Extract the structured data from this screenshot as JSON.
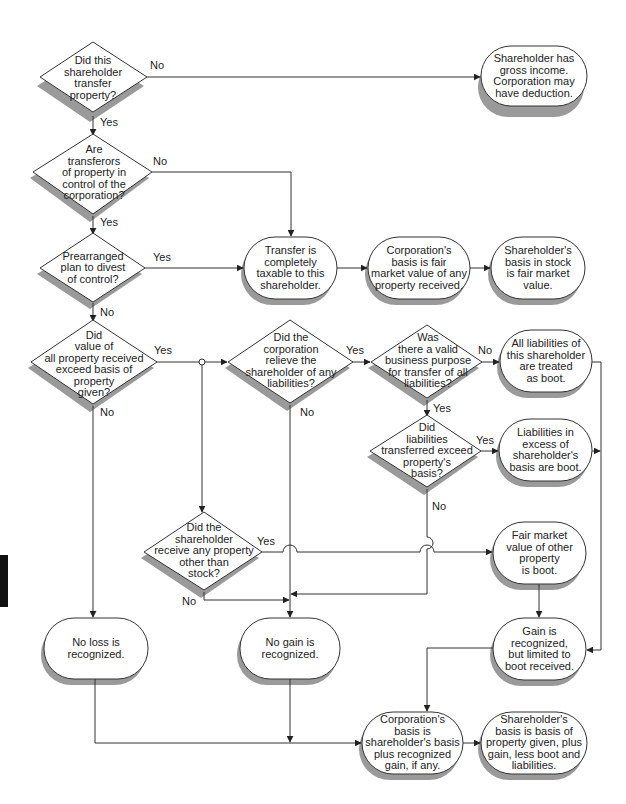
{
  "diagram": {
    "type": "flowchart",
    "nodes": {
      "q_transfer": {
        "shape": "diamond",
        "text": "Did this\nshareholder\ntransfer\nproperty?"
      },
      "r_gross_income": {
        "shape": "terminal",
        "text": "Shareholder has\ngross income.\nCorporation may\nhave deduction."
      },
      "q_control": {
        "shape": "diamond",
        "text": "Are\ntransferors\nof property in\ncontrol of the\ncorporation?"
      },
      "q_prearranged": {
        "shape": "diamond",
        "text": "Prearranged\nplan to divest\nof control?"
      },
      "r_taxable": {
        "shape": "terminal",
        "text": "Transfer is\ncompletely\ntaxable to this\nshareholder."
      },
      "r_corp_basis_fmv": {
        "shape": "terminal",
        "text": "Corporation's\nbasis is fair\nmarket value of any\nproperty received."
      },
      "r_sh_basis_fmv": {
        "shape": "terminal",
        "text": "Shareholder's\nbasis in stock\nis fair market\nvalue."
      },
      "q_value_exceed": {
        "shape": "diamond",
        "text": "Did\nvalue of\nall property received\nexceed basis of\nproperty\ngiven?"
      },
      "q_relieve": {
        "shape": "diamond",
        "text": "Did the\ncorporation\nrelieve the\nshareholder of any\nliabilities?"
      },
      "q_business_purpose": {
        "shape": "diamond",
        "text": "Was\nthere a valid\nbusiness purpose\nfor transfer of all\nliabilities?"
      },
      "r_all_liab_boot": {
        "shape": "terminal",
        "text": "All liabilities of\nthis shareholder\nare treated\nas boot."
      },
      "q_liab_exceed": {
        "shape": "diamond",
        "text": "Did\nliabilities\ntransferred exceed\nproperty's\nbasis?"
      },
      "r_liab_excess_boot": {
        "shape": "terminal",
        "text": "Liabilities in\nexcess of\nshareholder's\nbasis are boot."
      },
      "q_other_property": {
        "shape": "diamond",
        "text": "Did the\nshareholder\nreceive any property\nother than\nstock?"
      },
      "r_fmv_other_boot": {
        "shape": "terminal",
        "text": "Fair market\nvalue of other\nproperty\nis boot."
      },
      "r_no_loss": {
        "shape": "terminal",
        "text": "No loss is\nrecognized."
      },
      "r_no_gain": {
        "shape": "terminal",
        "text": "No gain is\nrecognized."
      },
      "r_gain_recognized": {
        "shape": "terminal",
        "text": "Gain is\nrecognized,\nbut limited to\nboot received."
      },
      "r_corp_basis_final": {
        "shape": "terminal",
        "text": "Corporation's\nbasis is\nshareholder's basis\nplus recognized\ngain, if any."
      },
      "r_sh_basis_final": {
        "shape": "terminal",
        "text": "Shareholder's\nbasis is basis of\nproperty given, plus\ngain, less boot and\nliabilities."
      }
    },
    "edge_labels": {
      "transfer_no": "No",
      "transfer_yes": "Yes",
      "control_no": "No",
      "control_yes": "Yes",
      "prearranged_yes": "Yes",
      "prearranged_no": "No",
      "value_yes": "Yes",
      "value_no": "No",
      "relieve_yes": "Yes",
      "relieve_no": "No",
      "purpose_no": "No",
      "purpose_yes": "Yes",
      "liab_yes": "Yes",
      "liab_no": "No",
      "other_yes": "Yes",
      "other_no": "No"
    },
    "edges": [
      {
        "from": "q_transfer",
        "to": "r_gross_income",
        "label": "No"
      },
      {
        "from": "q_transfer",
        "to": "q_control",
        "label": "Yes"
      },
      {
        "from": "q_control",
        "to": "r_taxable",
        "label": "No"
      },
      {
        "from": "q_control",
        "to": "q_prearranged",
        "label": "Yes"
      },
      {
        "from": "q_prearranged",
        "to": "r_taxable",
        "label": "Yes"
      },
      {
        "from": "q_prearranged",
        "to": "q_value_exceed",
        "label": "No"
      },
      {
        "from": "r_taxable",
        "to": "r_corp_basis_fmv",
        "label": ""
      },
      {
        "from": "r_corp_basis_fmv",
        "to": "r_sh_basis_fmv",
        "label": ""
      },
      {
        "from": "q_value_exceed",
        "to": "q_relieve",
        "label": "Yes"
      },
      {
        "from": "q_value_exceed",
        "to": "q_other_property",
        "label": "Yes"
      },
      {
        "from": "q_value_exceed",
        "to": "r_no_loss",
        "label": "No"
      },
      {
        "from": "q_relieve",
        "to": "q_business_purpose",
        "label": "Yes"
      },
      {
        "from": "q_relieve",
        "to": "r_no_gain",
        "label": "No"
      },
      {
        "from": "q_business_purpose",
        "to": "r_all_liab_boot",
        "label": "No"
      },
      {
        "from": "q_business_purpose",
        "to": "q_liab_exceed",
        "label": "Yes"
      },
      {
        "from": "q_liab_exceed",
        "to": "r_liab_excess_boot",
        "label": "Yes"
      },
      {
        "from": "q_liab_exceed",
        "to": "r_no_gain",
        "label": "No"
      },
      {
        "from": "q_other_property",
        "to": "r_fmv_other_boot",
        "label": "Yes"
      },
      {
        "from": "q_other_property",
        "to": "r_no_gain",
        "label": "No"
      },
      {
        "from": "r_all_liab_boot",
        "to": "r_gain_recognized",
        "label": ""
      },
      {
        "from": "r_liab_excess_boot",
        "to": "r_gain_recognized",
        "label": ""
      },
      {
        "from": "r_fmv_other_boot",
        "to": "r_gain_recognized",
        "label": ""
      },
      {
        "from": "r_gain_recognized",
        "to": "r_corp_basis_final",
        "label": ""
      },
      {
        "from": "r_no_loss",
        "to": "r_corp_basis_final",
        "label": ""
      },
      {
        "from": "r_no_gain",
        "to": "r_corp_basis_final",
        "label": ""
      },
      {
        "from": "r_corp_basis_final",
        "to": "r_sh_basis_final",
        "label": ""
      }
    ],
    "colors": {
      "line": "#333333",
      "shadow": "#9a9a9a",
      "fill": "#ffffff",
      "side_tab": "#111111"
    }
  }
}
